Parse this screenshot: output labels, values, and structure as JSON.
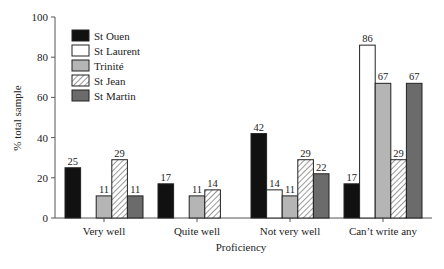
{
  "chart_data": {
    "type": "bar",
    "title": "",
    "xlabel": "Proficiency",
    "ylabel": "% total sample",
    "ylim": [
      0,
      100
    ],
    "yticks": [
      0,
      20,
      40,
      60,
      80,
      100
    ],
    "grid": false,
    "legend_position": "upper-left",
    "categories": [
      "Very well",
      "Quite well",
      "Not very well",
      "Can’t write any"
    ],
    "series": [
      {
        "name": "St Ouen",
        "fill": "#111111",
        "pattern": "solid",
        "values": [
          25,
          17,
          42,
          17
        ]
      },
      {
        "name": "St Laurent",
        "fill": "#ffffff",
        "pattern": "solid",
        "values": [
          null,
          null,
          14,
          86
        ]
      },
      {
        "name": "Trinité",
        "fill": "#b5b5b5",
        "pattern": "solid",
        "values": [
          11,
          11,
          11,
          67
        ]
      },
      {
        "name": "St Jean",
        "fill": "#ffffff",
        "pattern": "hatch",
        "values": [
          29,
          14,
          29,
          29
        ]
      },
      {
        "name": "St Martin",
        "fill": "#6b6b6b",
        "pattern": "solid",
        "values": [
          11,
          null,
          22,
          67
        ]
      }
    ]
  }
}
